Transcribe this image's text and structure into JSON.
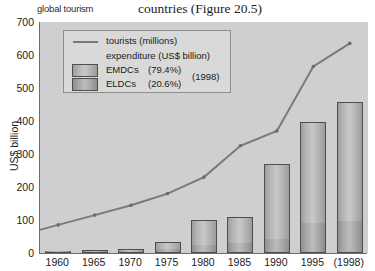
{
  "header": {
    "left_text": "global tourism",
    "right_text": "countries (Figure 20.5)"
  },
  "legend": {
    "tourists_label": "tourists (millions)",
    "expenditure_label": "expenditure (US$ billion)",
    "emdc_label": "EMDCs",
    "emdc_pct": "(79.4%)",
    "eldc_label": "ELDCs",
    "eldc_pct": "(20.6%)",
    "year_note": "(1998)"
  },
  "chart_data": {
    "type": "bar",
    "title": "",
    "xlabel": "",
    "ylabel": "US$ billion",
    "ylim": [
      0,
      700
    ],
    "yticks": [
      0,
      100,
      200,
      300,
      400,
      500,
      600,
      700
    ],
    "ytick_labels": [
      "0",
      "100",
      "200",
      "300",
      "400",
      "500",
      "600",
      "700"
    ],
    "grid": false,
    "legend_position": "upper-left-inside",
    "categories": [
      "1960",
      "1965",
      "1970",
      "1975",
      "1980",
      "1985",
      "1990",
      "1995",
      "(1998)"
    ],
    "series": [
      {
        "name": "ELDCs",
        "type": "bar-stack-bottom",
        "unit": "US$ billion",
        "values": [
          2,
          3,
          4,
          8,
          22,
          28,
          40,
          88,
          95
        ]
      },
      {
        "name": "EMDCs",
        "type": "bar-stack-top",
        "unit": "US$ billion",
        "values": [
          5,
          6,
          8,
          24,
          78,
          80,
          230,
          310,
          363
        ]
      },
      {
        "name": "tourists (millions)",
        "type": "line",
        "unit": "millions",
        "values": [
          85,
          115,
          145,
          180,
          230,
          325,
          370,
          565,
          635
        ]
      }
    ],
    "bar_totals": [
      7,
      9,
      12,
      32,
      100,
      108,
      270,
      398,
      458
    ],
    "annotations": [
      {
        "text": "EMDCs (79.4%)",
        "note": "share of 1998 expenditure"
      },
      {
        "text": "ELDCs (20.6%)",
        "note": "share of 1998 expenditure"
      }
    ]
  },
  "colors": {
    "plot_background": "#cfcfcf",
    "bar_fill": "#b8b8b8",
    "bar_border": "#4e4e4e",
    "line": "#7a7a7a",
    "axis": "#6d6d6d",
    "text": "#1b1b1b",
    "legend_background": "#d9d9d9"
  }
}
